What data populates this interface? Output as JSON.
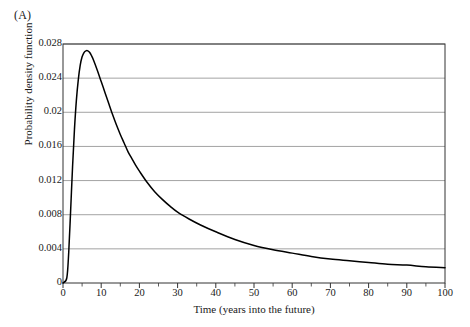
{
  "figure": {
    "panel_label": "(A)",
    "background": "#ffffff"
  },
  "chart_data": {
    "type": "line",
    "title": "",
    "panel": "(A)",
    "xlabel": "Time (years into the future)",
    "ylabel": "Probability density function",
    "xlim": [
      0,
      100
    ],
    "ylim": [
      0,
      0.028
    ],
    "grid": "horizontal",
    "legend": null,
    "line_color": "#000000",
    "grid_color": "#999999",
    "axis_color": "#333333",
    "xticks": [
      0,
      10,
      20,
      30,
      40,
      50,
      60,
      70,
      80,
      90,
      100
    ],
    "xtick_labels": [
      "0",
      "10",
      "20",
      "30",
      "40",
      "50",
      "60",
      "70",
      "80",
      "90",
      "100"
    ],
    "xminor_ticks": [
      5,
      15,
      25,
      35,
      45,
      55,
      65,
      75,
      85,
      95
    ],
    "yticks": [
      0,
      0.004,
      0.008,
      0.012,
      0.016,
      0.02,
      0.024,
      0.028
    ],
    "ytick_labels": [
      "0",
      "0.004",
      "0.008",
      "0.012",
      "0.016",
      "0.02",
      "0.024",
      "0.028"
    ],
    "series": [
      {
        "name": "probability density function",
        "x": [
          0,
          1,
          1.5,
          2,
          2.5,
          3,
          3.5,
          4,
          4.5,
          5,
          5.5,
          6,
          6.5,
          7,
          7.5,
          8,
          9,
          10,
          11,
          12,
          13,
          14,
          15,
          16,
          17,
          18,
          19,
          20,
          22,
          24,
          26,
          28,
          30,
          33,
          36,
          40,
          45,
          50,
          55,
          60,
          65,
          70,
          75,
          80,
          85,
          90,
          95,
          100
        ],
        "y": [
          0.0,
          0.0006,
          0.0036,
          0.0085,
          0.0136,
          0.018,
          0.0214,
          0.0238,
          0.0255,
          0.0265,
          0.027,
          0.0272,
          0.0272,
          0.027,
          0.0266,
          0.0261,
          0.0249,
          0.0236,
          0.0223,
          0.021,
          0.0197,
          0.0185,
          0.0174,
          0.0164,
          0.0154,
          0.0146,
          0.0138,
          0.0131,
          0.0118,
          0.0107,
          0.0098,
          0.009,
          0.0083,
          0.0075,
          0.0068,
          0.006,
          0.0051,
          0.0044,
          0.0039,
          0.0035,
          0.0031,
          0.0028,
          0.0026,
          0.0024,
          0.0022,
          0.0021,
          0.0019,
          0.0018
        ]
      }
    ]
  }
}
